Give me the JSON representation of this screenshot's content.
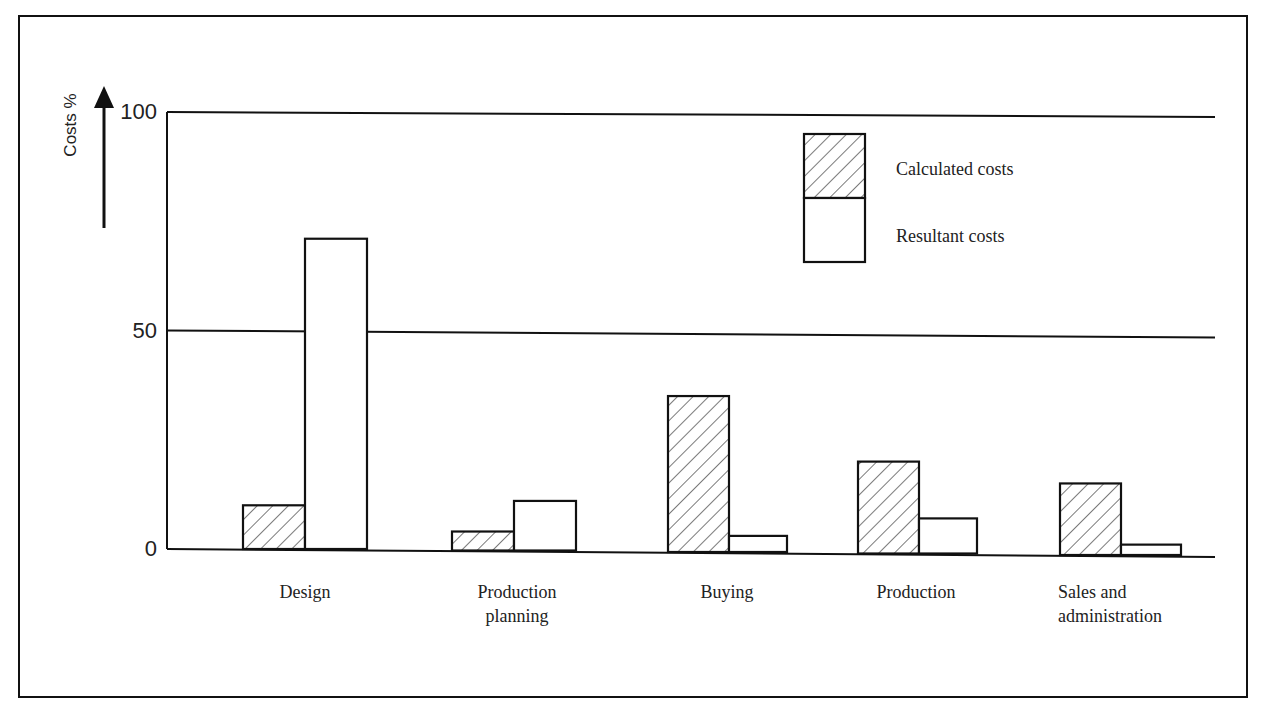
{
  "chart_data": {
    "type": "bar",
    "title": "",
    "xlabel": "",
    "ylabel": "Costs %",
    "ylim": [
      0,
      100
    ],
    "yticks": [
      0,
      50,
      100
    ],
    "grid": "horizontal lines at 50 and 100",
    "legend_position": "upper right inside plot",
    "categories": [
      [
        "Design"
      ],
      [
        "Production",
        "planning"
      ],
      [
        "Buying"
      ],
      [
        "Production"
      ],
      [
        "Sales and",
        "administration"
      ]
    ],
    "category_names": [
      "Design",
      "Production planning",
      "Buying",
      "Production",
      "Sales and administration"
    ],
    "series": [
      {
        "name": "Calculated costs",
        "pattern": "hatched",
        "values": [
          10,
          4,
          35,
          20,
          15
        ]
      },
      {
        "name": "Resultant costs",
        "pattern": "empty",
        "values": [
          71,
          11,
          3,
          7,
          1
        ]
      }
    ]
  },
  "colors": {
    "ink": "#111111",
    "background": "#ffffff"
  }
}
